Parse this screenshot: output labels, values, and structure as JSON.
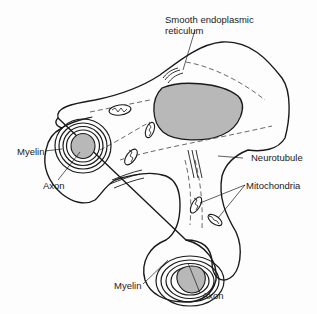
{
  "diagram": {
    "type": "anatomical line drawing",
    "colors": {
      "outline": "#1a1a1a",
      "fill_shaded": "#b8b8b8",
      "background": "#fdfdfd"
    },
    "labels": {
      "ser_line1": "Smooth endoplasmic",
      "ser_line2": "reticulum",
      "neurotubule": "Neurotubule",
      "mitochondria": "Mitochondria",
      "myelin_upper": "Myelin",
      "axon_upper": "Axon",
      "myelin_lower": "Myelin",
      "axon_lower": "Axon"
    }
  }
}
